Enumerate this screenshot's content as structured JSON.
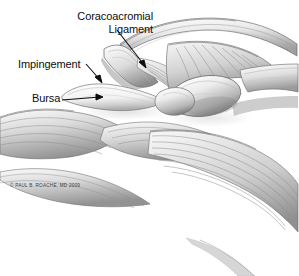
{
  "illustration": {
    "title": "Shoulder Impingement Anatomy",
    "subject": "Lateral view of the shoulder showing the acromion, coracoacromial ligament, subacromial bursa and rotator cuff",
    "style": "grayscale pencil medical illustration",
    "background_color": "#ffffff",
    "ink_color": "#0d0d0d"
  },
  "labels": [
    {
      "id": "coracoacromial-ligament",
      "line1": "Coracoacromial",
      "line2": "Ligament",
      "leader": "arrow",
      "leader_direction": "down-right"
    },
    {
      "id": "impingement",
      "text": "Impingement",
      "leader": "arrow",
      "leader_direction": "down-right"
    },
    {
      "id": "bursa",
      "text": "Bursa",
      "leader": "line-with-arrow",
      "leader_direction": "right"
    }
  ],
  "credit": {
    "text": "© PAUL B. ROACHE, MD 2009"
  }
}
